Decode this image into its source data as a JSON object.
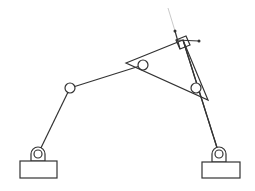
{
  "diagram": {
    "type": "four-bar linkage mechanism",
    "colors": {
      "stroke": "#333333",
      "faint": "#bbbbbb",
      "background": "#ffffff"
    },
    "supports": [
      {
        "id": "left-ground",
        "pivot": [
          38,
          154
        ],
        "rect": [
          20,
          161,
          37,
          17
        ]
      },
      {
        "id": "right-ground",
        "pivot": [
          219,
          154
        ],
        "rect": [
          202,
          162,
          38,
          16
        ]
      }
    ],
    "joints": [
      {
        "id": "middle-joint",
        "pos": [
          70,
          88
        ]
      },
      {
        "id": "triangle-left-pin",
        "pos": [
          143,
          65
        ]
      },
      {
        "id": "triangle-right-pin",
        "pos": [
          196,
          88
        ]
      }
    ],
    "triangle": {
      "vertices": [
        [
          126,
          63
        ],
        [
          183,
          40
        ],
        [
          208,
          100
        ]
      ]
    }
  }
}
